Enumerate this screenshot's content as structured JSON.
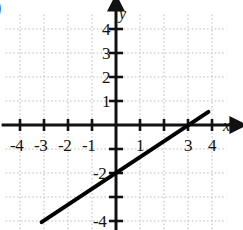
{
  "figure": {
    "corner_marker": ")",
    "background_color": "#ffffff",
    "ink_color": "#111111",
    "grid_color": "#bdbdbd",
    "line_color": "#000000"
  },
  "axes": {
    "x_label": "x",
    "y_label": "y",
    "x_label_pos": {
      "x": 223,
      "y": 118
    },
    "y_label_pos": {
      "x": 119,
      "y": 6
    },
    "origin_px": {
      "x": 116,
      "y": 125
    },
    "unit_px": 24,
    "x_range": [
      -4.6,
      4.6
    ],
    "y_range": [
      -4.6,
      4.6
    ],
    "grid": true,
    "grid_style": "dotted",
    "arrowheads": [
      "x-positive",
      "y-positive"
    ]
  },
  "ticks": {
    "x_labels": [
      {
        "value": -4,
        "text": "-4"
      },
      {
        "value": -3,
        "text": "-3"
      },
      {
        "value": -2,
        "text": "-2"
      },
      {
        "value": -1,
        "text": "-1"
      },
      {
        "value": 1,
        "text": "1"
      },
      {
        "value": 3,
        "text": "3"
      },
      {
        "value": 4,
        "text": "4"
      }
    ],
    "y_labels": [
      {
        "value": 4,
        "text": "4"
      },
      {
        "value": 3,
        "text": "3"
      },
      {
        "value": 2,
        "text": "2"
      },
      {
        "value": 1,
        "text": "1"
      },
      {
        "value": -2,
        "text": "-2"
      },
      {
        "value": -4,
        "text": "-4"
      }
    ],
    "x_tick_marks": [
      -4,
      -3,
      -2,
      -1,
      1,
      2,
      3,
      4
    ],
    "y_tick_marks": [
      -4,
      -3,
      -2,
      -1,
      1,
      2,
      3,
      4
    ]
  },
  "chart_data": {
    "type": "line",
    "xlabel": "x",
    "ylabel": "y",
    "xlim": [
      -4.6,
      4.6
    ],
    "ylim": [
      -4.6,
      4.6
    ],
    "grid": true,
    "legend": null,
    "series": [
      {
        "name": "y = (2/3)x - 2",
        "equation": "y = (2/3)x - 2",
        "slope": 0.6667,
        "intercept": -2,
        "x_intercept": 3,
        "y_intercept": -2,
        "endpoints": [
          {
            "x": -3.1,
            "y": -4.05
          },
          {
            "x": 3.85,
            "y": 0.55
          }
        ],
        "x": [
          -3.1,
          0,
          3,
          3.85
        ],
        "values": [
          -4.05,
          -2,
          0,
          0.55
        ],
        "style": "solid",
        "width_px": 4,
        "color": "#000000"
      }
    ]
  }
}
